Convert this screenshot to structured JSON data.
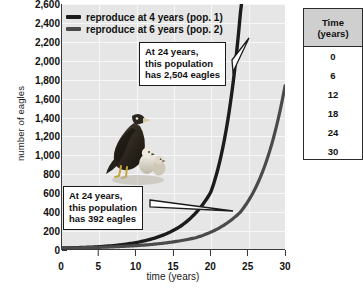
{
  "chart_data": {
    "type": "line",
    "title": "",
    "xlabel": "time (years)",
    "ylabel": "number of eagles",
    "xlim": [
      0,
      30
    ],
    "ylim": [
      0,
      2600
    ],
    "grid": true,
    "legend_position": "top-left",
    "x_ticks": [
      "0",
      "5",
      "10",
      "15",
      "20",
      "25",
      "30"
    ],
    "y_ticks": [
      "0",
      "200",
      "400",
      "600",
      "800",
      "1,000",
      "1,200",
      "1,400",
      "1,600",
      "1,800",
      "2,000",
      "2,200",
      "2,400",
      "2,600"
    ],
    "series": [
      {
        "name": "reproduce at 4 years (pop. 1)",
        "color": "#1c1c1c",
        "x": [
          0,
          4,
          8,
          12,
          16,
          20,
          24,
          26,
          28,
          30
        ],
        "values": [
          10,
          20,
          45,
          105,
          245,
          600,
          2504,
          4200,
          7000,
          11000
        ]
      },
      {
        "name": "reproduce at 6 years (pop. 2)",
        "color": "#4a4a4a",
        "x": [
          0,
          6,
          12,
          18,
          24,
          30
        ],
        "values": [
          10,
          20,
          48,
          120,
          392,
          1730
        ]
      }
    ],
    "annotations": [
      {
        "id": "high",
        "lines": [
          "At 24 years,",
          "this population",
          "has 2,504 eagles"
        ],
        "points_to_series": "reproduce at 4 years (pop. 1)",
        "at_year": 24,
        "value": 2504
      },
      {
        "id": "low",
        "lines": [
          "At 24 years,",
          "this population",
          "has 392 eagles"
        ],
        "points_to_series": "reproduce at 6 years (pop. 2)",
        "at_year": 24,
        "value": 392
      }
    ]
  },
  "legend": {
    "items": [
      {
        "label": "reproduce at 4 years (pop. 1)",
        "color": "#1c1c1c"
      },
      {
        "label": "reproduce at 6 years (pop. 2)",
        "color": "#4a4a4a"
      }
    ]
  },
  "axes": {
    "x_title": "time (years)",
    "y_title": "number of eagles"
  },
  "table": {
    "header_line1": "Time",
    "header_line2": "(years)",
    "rows": [
      "0",
      "6",
      "12",
      "18",
      "24",
      "30"
    ]
  },
  "photo": {
    "caption": "bald eagle adult with two chicks"
  }
}
